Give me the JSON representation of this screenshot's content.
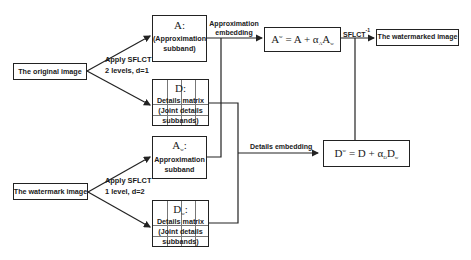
{
  "diagram": {
    "original_image": "The original image",
    "watermark_image": "The watermark image",
    "watermarked_image": "The watermarked image",
    "apply_top": [
      "Apply SFLCT",
      "2 levels, d=1"
    ],
    "apply_bottom": [
      "Apply SFLCT",
      "1 level, d=2"
    ],
    "approx_box": {
      "symbol": "A",
      "suffix": ":",
      "line1": "(Approximation",
      "line2": "subband)"
    },
    "details_box": {
      "symbol": "D",
      "suffix": ":",
      "line1": "Details matrix",
      "line2": "(Joint details",
      "line3": "subbands)"
    },
    "approx_w_box": {
      "symbol": "A",
      "subscript": "w",
      "suffix": ":",
      "line1": "Approximation",
      "line2": "subband"
    },
    "details_w_box": {
      "symbol": "D",
      "subscript": "w",
      "suffix": ":",
      "line1": "Details matrix",
      "line2": "(Joint details",
      "line3": "subbands)"
    },
    "approx_embedding": [
      "Approximation",
      "embedding"
    ],
    "details_embedding": "Details embedding",
    "inverse_transform": "SFLCT",
    "inverse_exponent": "-1",
    "formula_a": {
      "lhs": "A",
      "lhs_sup": "w",
      "eq": " = A + α",
      "alpha_sub": "A",
      "term": "A",
      "term_sub": "w"
    },
    "formula_d": {
      "lhs": "D",
      "lhs_sup": "w",
      "eq": " = D + α",
      "alpha_sub": "D",
      "term": "D",
      "term_sub": "w"
    }
  }
}
